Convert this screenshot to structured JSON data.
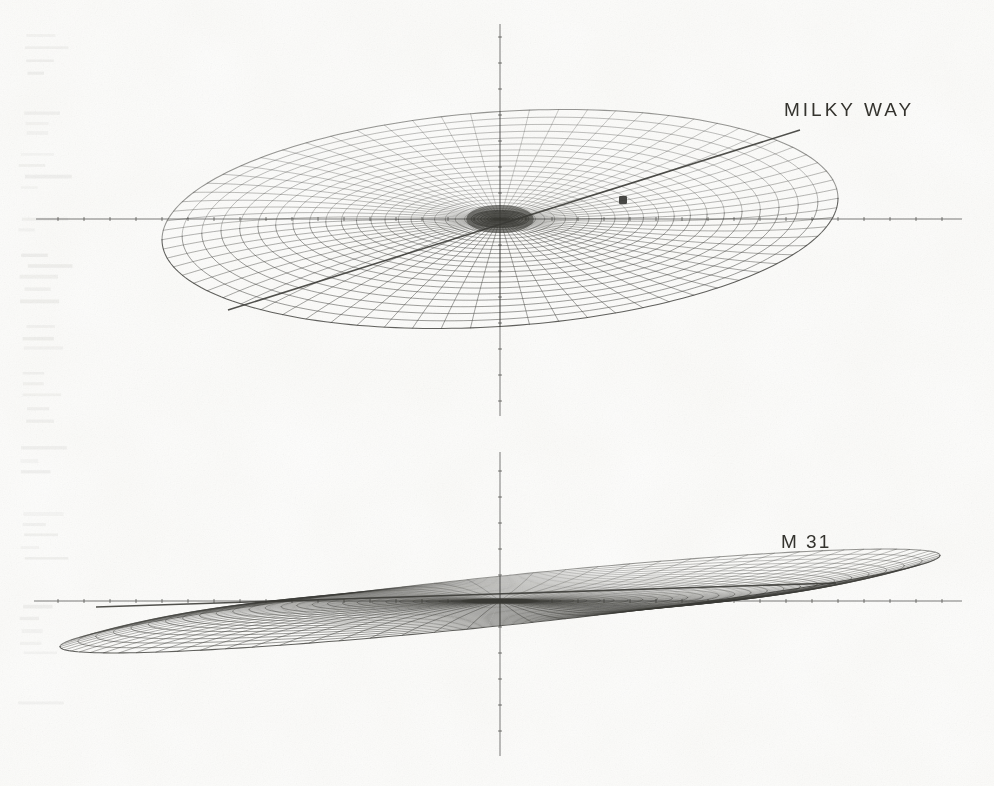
{
  "figure": {
    "kind": "scanned-line-figure",
    "title_visible": false,
    "background_color": "#fdfdfc",
    "ink_color": "#3a3a36",
    "width": 994,
    "height": 786
  },
  "panels": [
    {
      "id": "milky-way",
      "label": "MILKY WAY",
      "label_x": 784,
      "label_y": 99,
      "object_name": "Milky Way",
      "view": "inclined",
      "center_x": 500,
      "center_y": 219,
      "radius_x": 338,
      "radius_y": 185,
      "inclination_deg": 33,
      "n_rings": 26,
      "n_spokes": 72,
      "bulge_radius_frac": 0.085,
      "warp_amplitude": 26,
      "warp_phase_deg": 18,
      "ring_power": 1.62,
      "axis": {
        "h_x1": 36,
        "h_x2": 962,
        "h_y": 219,
        "v_y1": 24,
        "v_y2": 416,
        "v_x": 500,
        "tick_spacing": 26,
        "tick_len": 4
      },
      "feature_line": {
        "name": "major-axis-cut",
        "x1": 228,
        "y1": 310,
        "x2": 800,
        "y2": 130
      },
      "marker": {
        "name": "sun-position",
        "x": 623,
        "y": 200,
        "size": 8,
        "shape": "square"
      }
    },
    {
      "id": "m31",
      "label": "M 31",
      "label_x": 781,
      "label_y": 531,
      "object_name": "M31",
      "view": "near-edge-on",
      "center_x": 500,
      "center_y": 601,
      "radius_x": 440,
      "radius_y": 190,
      "inclination_deg": 7.5,
      "n_rings": 30,
      "n_spokes": 84,
      "bulge_radius_frac": 0.075,
      "warp_amplitude": 46,
      "warp_phase_deg": 0,
      "ring_power": 1.25,
      "axis": {
        "h_x1": 34,
        "h_x2": 962,
        "h_y": 601,
        "v_y1": 452,
        "v_y2": 756,
        "v_x": 500,
        "tick_spacing": 26,
        "tick_len": 4
      },
      "feature_line": {
        "name": "major-axis-cut",
        "x1": 96,
        "y1": 607,
        "x2": 836,
        "y2": 583
      },
      "marker": null
    }
  ],
  "chart_data": {
    "type": "line",
    "xlabel": "",
    "ylabel": "",
    "legend": [
      "MILKY WAY",
      "M 31"
    ],
    "annotations": [
      "MILKY WAY",
      "M 31"
    ],
    "series": [
      {
        "name": "MILKY WAY",
        "representation": "polar wireframe mesh, inclined disk",
        "inclination_deg": 33,
        "rings": 26,
        "spokes": 72,
        "markers": [
          {
            "label": "Sun",
            "x_px": 623,
            "y_px": 200
          }
        ]
      },
      {
        "name": "M 31",
        "representation": "polar wireframe mesh, near edge-on warped disk",
        "inclination_deg": 7.5,
        "rings": 30,
        "spokes": 84,
        "markers": []
      }
    ],
    "grid": true,
    "legend_position": "inline-right"
  }
}
